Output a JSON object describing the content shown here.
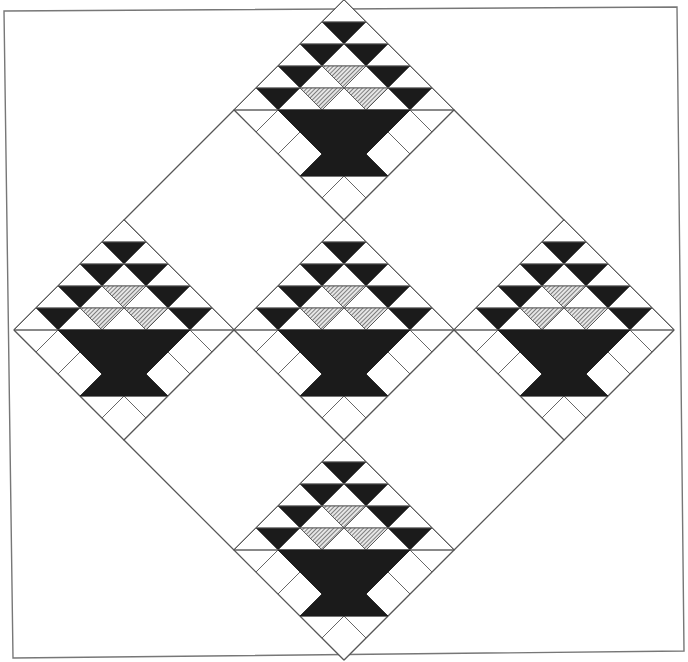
{
  "title": "Basket quilt block layout — five baskets set on point",
  "canvas": {
    "width": 688,
    "height": 662,
    "background": "#ffffff"
  },
  "colors": {
    "ink": "#1b1b1b",
    "line": "#555555",
    "frame": "#777777",
    "white": "#ffffff",
    "hatch_bg": "#e6e6e6",
    "hatch_line": "#3a3a3a"
  },
  "frame": {
    "points": [
      [
        4,
        11
      ],
      [
        677,
        7
      ],
      [
        684,
        651
      ],
      [
        13,
        658
      ]
    ]
  },
  "layout": {
    "center": [
      344,
      330
    ],
    "block_half_diagonal": 110,
    "grid": "3x3 on point",
    "unit_per_row": 22
  },
  "blocks": [
    {
      "name": "basket-block-top",
      "grid": [
        -1,
        -1
      ],
      "has_basket": true
    },
    {
      "name": "plain-block-top-right",
      "grid": [
        0,
        -1
      ],
      "has_basket": false
    },
    {
      "name": "basket-block-right",
      "grid": [
        1,
        -1
      ],
      "has_basket": true
    },
    {
      "name": "plain-block-top-left",
      "grid": [
        -1,
        0
      ],
      "has_basket": false
    },
    {
      "name": "basket-block-center",
      "grid": [
        0,
        0
      ],
      "has_basket": true
    },
    {
      "name": "plain-block-bottom-right",
      "grid": [
        1,
        0
      ],
      "has_basket": false
    },
    {
      "name": "basket-block-left",
      "grid": [
        -1,
        1
      ],
      "has_basket": true
    },
    {
      "name": "plain-block-bottom-left",
      "grid": [
        0,
        1
      ],
      "has_basket": false
    },
    {
      "name": "basket-block-bottom",
      "grid": [
        1,
        1
      ],
      "has_basket": true
    }
  ],
  "basket_design": {
    "triangle_rows": 5,
    "up_triangle_fill": "white",
    "down_triangle_fills": [
      [],
      [
        "black"
      ],
      [
        "black",
        "black"
      ],
      [
        "black",
        "hatched",
        "black"
      ],
      [
        "black",
        "hatched",
        "hatched",
        "black"
      ]
    ],
    "basket_body": [
      [
        -3,
        0
      ],
      [
        3,
        0
      ],
      [
        1,
        2
      ],
      [
        2,
        3
      ],
      [
        -2,
        3
      ],
      [
        -1,
        2
      ]
    ],
    "border_lines": [
      [
        [
          -4,
          1
        ],
        [
          -3,
          0
        ]
      ],
      [
        [
          -3,
          2
        ],
        [
          -2,
          1
        ]
      ],
      [
        [
          4,
          1
        ],
        [
          3,
          0
        ]
      ],
      [
        [
          3,
          2
        ],
        [
          2,
          1
        ]
      ],
      [
        [
          0,
          3
        ],
        [
          -1,
          4
        ]
      ],
      [
        [
          0,
          3
        ],
        [
          1,
          4
        ]
      ]
    ]
  }
}
